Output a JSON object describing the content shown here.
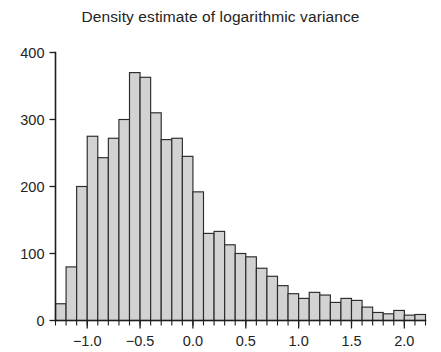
{
  "chart_data": {
    "type": "bar",
    "title": "Density estimate of logarithmic variance",
    "xlabel": "",
    "ylabel": "",
    "grid": false,
    "legend": false,
    "legend_position": "none",
    "xlim": [
      -1.3,
      2.2
    ],
    "ylim": [
      0,
      400
    ],
    "bin_width": 0.1,
    "xticks": [
      -1.0,
      -0.5,
      0.0,
      0.5,
      1.0,
      1.5,
      2.0
    ],
    "xtick_labels": [
      "-1.0",
      "-0.5",
      "0.0",
      "0.5",
      "1.0",
      "1.5",
      "2.0"
    ],
    "yticks": [
      0,
      100,
      200,
      300,
      400
    ],
    "ytick_labels": [
      "0",
      "100",
      "200",
      "300",
      "400"
    ],
    "bin_edges": [
      -1.3,
      -1.2,
      -1.1,
      -1.0,
      -0.9,
      -0.8,
      -0.7,
      -0.6,
      -0.5,
      -0.4,
      -0.3,
      -0.2,
      -0.1,
      0.0,
      0.1,
      0.2,
      0.3,
      0.4,
      0.5,
      0.6,
      0.7,
      0.8,
      0.9,
      1.0,
      1.1,
      1.2,
      1.3,
      1.4,
      1.5,
      1.6,
      1.7,
      1.8,
      1.9,
      2.0,
      2.1,
      2.2
    ],
    "bin_centers": [
      -1.25,
      -1.15,
      -1.05,
      -0.95,
      -0.85,
      -0.75,
      -0.65,
      -0.55,
      -0.45,
      -0.35,
      -0.25,
      -0.15,
      -0.05,
      0.05,
      0.15,
      0.25,
      0.35,
      0.45,
      0.55,
      0.65,
      0.75,
      0.85,
      0.95,
      1.05,
      1.15,
      1.25,
      1.35,
      1.45,
      1.55,
      1.65,
      1.75,
      1.85,
      1.95,
      2.05,
      2.15
    ],
    "categories": [
      "-1.25",
      "-1.15",
      "-1.05",
      "-0.95",
      "-0.85",
      "-0.75",
      "-0.65",
      "-0.55",
      "-0.45",
      "-0.35",
      "-0.25",
      "-0.15",
      "-0.05",
      "0.05",
      "0.15",
      "0.25",
      "0.35",
      "0.45",
      "0.55",
      "0.65",
      "0.75",
      "0.85",
      "0.95",
      "1.05",
      "1.15",
      "1.25",
      "1.35",
      "1.45",
      "1.55",
      "1.65",
      "1.75",
      "1.85",
      "1.95",
      "2.05",
      "2.15"
    ],
    "values": [
      25,
      80,
      200,
      275,
      243,
      272,
      300,
      370,
      363,
      310,
      270,
      272,
      245,
      192,
      130,
      133,
      113,
      100,
      95,
      78,
      66,
      52,
      40,
      33,
      42,
      38,
      27,
      33,
      30,
      20,
      12,
      10,
      15,
      8,
      9
    ],
    "series": [
      {
        "name": "count",
        "values": [
          25,
          80,
          200,
          275,
          243,
          272,
          300,
          370,
          363,
          310,
          270,
          272,
          245,
          192,
          130,
          133,
          113,
          100,
          95,
          78,
          66,
          52,
          40,
          33,
          42,
          38,
          27,
          33,
          30,
          20,
          12,
          10,
          15,
          8,
          9
        ]
      }
    ],
    "colors": {
      "bar_fill": "#d2d2d2",
      "bar_stroke": "#2a2a2a",
      "axis": "#1d1d1d",
      "text": "#232323",
      "background": "#ffffff"
    }
  }
}
